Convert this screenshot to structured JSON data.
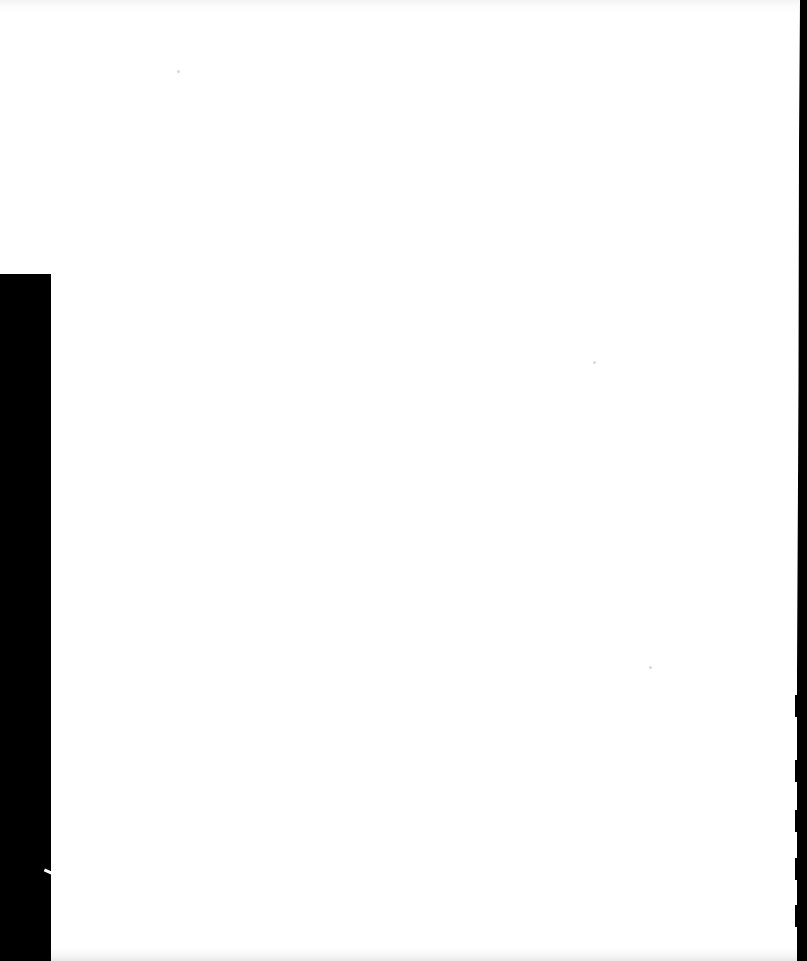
{
  "document": {
    "type": "scanned-page",
    "content": "",
    "colors": {
      "paper": "#ffffff",
      "scan_border": "#000000"
    },
    "scan_edges": {
      "left_border": {
        "x": 0,
        "y": 274,
        "width": 51,
        "height": 687
      },
      "right_border": {
        "x": 797,
        "y": 0,
        "width": 10,
        "height": 961
      },
      "right_tabs_y": [
        695,
        760,
        810,
        860,
        905
      ]
    }
  }
}
